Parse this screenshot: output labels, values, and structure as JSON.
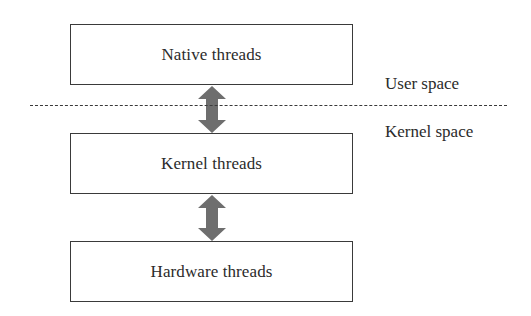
{
  "diagram": {
    "type": "layered-block-diagram",
    "layers": [
      {
        "id": "native",
        "label": "Native threads"
      },
      {
        "id": "kernel",
        "label": "Kernel threads"
      },
      {
        "id": "hardware",
        "label": "Hardware threads"
      }
    ],
    "connections": [
      {
        "from": "native",
        "to": "kernel",
        "direction": "bidirectional"
      },
      {
        "from": "kernel",
        "to": "hardware",
        "direction": "bidirectional"
      }
    ],
    "boundary": {
      "style": "dashed",
      "above_label": "User space",
      "below_label": "Kernel space"
    },
    "colors": {
      "box_border": "#3a3a3a",
      "arrow_fill": "#6e6e6e",
      "text": "#2b2b2b",
      "background": "#ffffff"
    }
  }
}
